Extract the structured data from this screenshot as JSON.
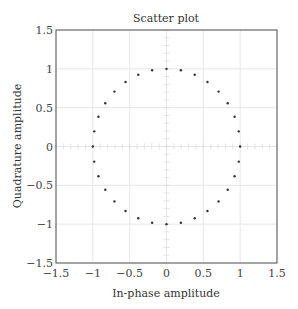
{
  "chart_data": {
    "type": "scatter",
    "title": "Scatter plot",
    "xlabel": "In-phase amplitude",
    "ylabel": "Quadrature amplitude",
    "xlim": [
      -1.5,
      1.5
    ],
    "ylim": [
      -1.5,
      1.5
    ],
    "xticks": [
      -1.5,
      -1,
      -0.5,
      0,
      0.5,
      1,
      1.5
    ],
    "yticks": [
      -1.5,
      -1,
      -0.5,
      0,
      0.5,
      1,
      1.5
    ],
    "xtick_labels": [
      "−1.5",
      "−1",
      "−0.5",
      "0",
      "0.5",
      "1",
      "1.5"
    ],
    "ytick_labels": [
      "−1.5",
      "−1",
      "−0.5",
      "0",
      "0.5",
      "1",
      "1.5"
    ],
    "grid": true,
    "legend": null,
    "marker": "dot",
    "marker_color": "#333333",
    "grid_color": "#e6e6e6",
    "series": [
      {
        "name": "constellation",
        "points_count": 32,
        "x": [
          1.0,
          0.981,
          0.924,
          0.831,
          0.707,
          0.556,
          0.383,
          0.195,
          0.0,
          -0.195,
          -0.383,
          -0.556,
          -0.707,
          -0.831,
          -0.924,
          -0.981,
          -1.0,
          -0.981,
          -0.924,
          -0.831,
          -0.707,
          -0.556,
          -0.383,
          -0.195,
          0.0,
          0.195,
          0.383,
          0.556,
          0.707,
          0.831,
          0.924,
          0.981
        ],
        "y": [
          0.0,
          0.195,
          0.383,
          0.556,
          0.707,
          0.831,
          0.924,
          0.981,
          1.0,
          0.981,
          0.924,
          0.831,
          0.707,
          0.556,
          0.383,
          0.195,
          0.0,
          -0.195,
          -0.383,
          -0.556,
          -0.707,
          -0.831,
          -0.924,
          -0.981,
          -1.0,
          -0.981,
          -0.924,
          -0.831,
          -0.707,
          -0.556,
          -0.383,
          -0.195
        ]
      }
    ]
  }
}
